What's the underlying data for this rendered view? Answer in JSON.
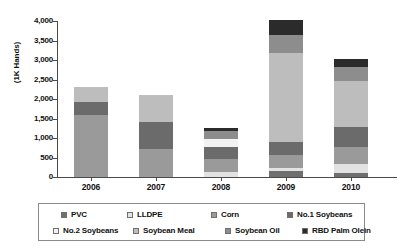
{
  "chart_data": {
    "type": "bar",
    "stacked": true,
    "title": "",
    "subtitle": "",
    "xlabel": "",
    "ylabel": "(1K Hands)",
    "categories": [
      "2006",
      "2007",
      "2008",
      "2009",
      "2010"
    ],
    "ylim": [
      0,
      4000
    ],
    "ytick_labels": [
      "0",
      "500",
      "1,000",
      "1,500",
      "2,000",
      "2,500",
      "3,000",
      "3,500",
      "4,000"
    ],
    "ytick_values": [
      0,
      500,
      1000,
      1500,
      2000,
      2500,
      3000,
      3500,
      4000
    ],
    "grid": false,
    "legend_position": "bottom",
    "series": [
      {
        "name": "PVC",
        "color": "#6f6f6f",
        "values": [
          0,
          0,
          0,
          160,
          100
        ]
      },
      {
        "name": "LLDPE",
        "color": "#e2e2e2",
        "values": [
          0,
          0,
          130,
          60,
          230
        ]
      },
      {
        "name": "Corn",
        "color": "#9a9a9a",
        "values": [
          1580,
          730,
          320,
          350,
          450
        ]
      },
      {
        "name": "No.1 Soybeans",
        "color": "#6b6b6b",
        "values": [
          340,
          690,
          330,
          330,
          500
        ]
      },
      {
        "name": "No.2 Soybeans",
        "color": "#f2f2f2",
        "values": [
          0,
          0,
          190,
          0,
          0
        ]
      },
      {
        "name": "Soybean Meal",
        "color": "#bdbdbd",
        "values": [
          390,
          690,
          0,
          2290,
          1180
        ]
      },
      {
        "name": "Soybean Oil",
        "color": "#8d8d8d",
        "values": [
          0,
          0,
          220,
          440,
          370
        ]
      },
      {
        "name": "RBD Palm Olein",
        "color": "#2b2b2b",
        "values": [
          0,
          0,
          70,
          390,
          200
        ]
      }
    ],
    "totals": [
      2310,
      2110,
      1260,
      3620,
      3030
    ]
  },
  "legend": {
    "items": [
      {
        "label": "PVC"
      },
      {
        "label": "LLDPE"
      },
      {
        "label": "Corn"
      },
      {
        "label": "No.1 Soybeans"
      },
      {
        "label": "No.2 Soybeans"
      },
      {
        "label": "Soybean Meal"
      },
      {
        "label": "Soybean Oil"
      },
      {
        "label": "RBD Palm Olein"
      }
    ]
  }
}
